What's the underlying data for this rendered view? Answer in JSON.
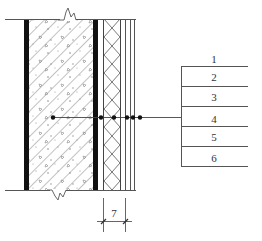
{
  "diagram": {
    "type": "wall-section-detail",
    "colors": {
      "line": "#444444",
      "heavy": "#111111",
      "hatch": "#666666",
      "background": "#ffffff"
    },
    "layers": [
      {
        "id": 1,
        "name": "concrete-wall",
        "pattern": "diagonal-hatch-with-aggregate"
      },
      {
        "id": 2,
        "name": "membrane",
        "pattern": "solid-black"
      },
      {
        "id": 3,
        "name": "insulation",
        "pattern": "crosshatch"
      },
      {
        "id": 4,
        "name": "thin-layer-a",
        "pattern": "line"
      },
      {
        "id": 5,
        "name": "thin-layer-b",
        "pattern": "line"
      },
      {
        "id": 6,
        "name": "thin-layer-c",
        "pattern": "line"
      }
    ],
    "labels": [
      "1",
      "2",
      "3",
      "4",
      "5",
      "6"
    ],
    "dimension": {
      "value": "7"
    }
  }
}
